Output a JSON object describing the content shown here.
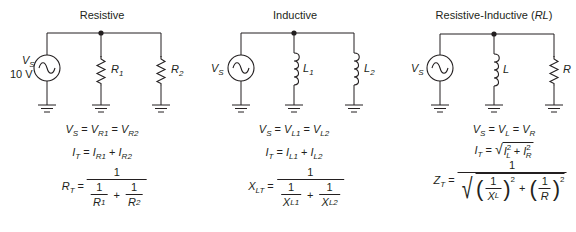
{
  "panels": [
    {
      "title": "Resistive",
      "source_label": "V",
      "source_sub": "S",
      "source_value": "10 V",
      "branch1_label": "R",
      "branch1_sub": "1",
      "branch2_label": "R",
      "branch2_sub": "2",
      "branch1_type": "resistor",
      "branch2_type": "resistor",
      "equations": {
        "voltage": {
          "lhs": "V",
          "lhs_sub": "S",
          "t1": "V",
          "t1_sub": "R1",
          "t2": "V",
          "t2_sub": "R2"
        },
        "current": {
          "lhs": "I",
          "lhs_sub": "T",
          "t1": "I",
          "t1_sub": "R1",
          "t2": "I",
          "t2_sub": "R2",
          "op": "+"
        },
        "total": {
          "lhs": "R",
          "lhs_sub": "T",
          "numerator": "1",
          "d1_num": "1",
          "d1": "R",
          "d1_sub": "1",
          "d2_num": "1",
          "d2": "R",
          "d2_sub": "2",
          "op": "+"
        }
      }
    },
    {
      "title": "Inductive",
      "source_label": "V",
      "source_sub": "S",
      "branch1_label": "L",
      "branch1_sub": "1",
      "branch2_label": "L",
      "branch2_sub": "2",
      "branch1_type": "inductor",
      "branch2_type": "inductor",
      "equations": {
        "voltage": {
          "lhs": "V",
          "lhs_sub": "S",
          "t1": "V",
          "t1_sub": "L1",
          "t2": "V",
          "t2_sub": "L2"
        },
        "current": {
          "lhs": "I",
          "lhs_sub": "T",
          "t1": "I",
          "t1_sub": "L1",
          "t2": "I",
          "t2_sub": "L2",
          "op": "+"
        },
        "total": {
          "lhs": "X",
          "lhs_sub": "LT",
          "numerator": "1",
          "d1_num": "1",
          "d1": "X",
          "d1_sub": "L1",
          "d2_num": "1",
          "d2": "X",
          "d2_sub": "L2",
          "op": "+"
        }
      }
    },
    {
      "title_prefix": "Resistive-Inductive (",
      "title_italic": "RL",
      "title_suffix": ")",
      "source_label": "V",
      "source_sub": "S",
      "branch1_label": "L",
      "branch2_label": "R",
      "branch1_type": "inductor",
      "branch2_type": "resistor",
      "equations": {
        "voltage": {
          "lhs": "V",
          "lhs_sub": "S",
          "t1": "V",
          "t1_sub": "L",
          "t2": "V",
          "t2_sub": "R"
        },
        "current": {
          "lhs": "I",
          "lhs_sub": "T",
          "t1": "I",
          "t1_sub": "L",
          "t1_sup": "2",
          "t2": "I",
          "t2_sub": "R",
          "t2_sup": "2",
          "op": "+"
        },
        "total": {
          "lhs": "Z",
          "lhs_sub": "T",
          "numerator": "1",
          "d1_num": "1",
          "d1": "X",
          "d1_sub": "L",
          "d2_num": "1",
          "d2": "R",
          "exp": "2",
          "op": "+"
        }
      }
    }
  ],
  "common": {
    "equals": "="
  }
}
